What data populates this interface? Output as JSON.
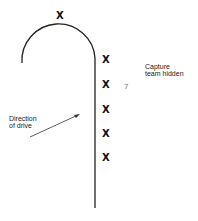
{
  "diagram": {
    "labels": {
      "capture_team": "Capture\nteam hidden",
      "direction": "Direction\nof drive",
      "seven_mark": "7"
    },
    "markers": {
      "top": "X",
      "column": [
        "X",
        "X",
        "X",
        "X",
        "X"
      ]
    },
    "colors": {
      "line": "#222222",
      "text": "#222222",
      "background": "#ffffff"
    }
  }
}
